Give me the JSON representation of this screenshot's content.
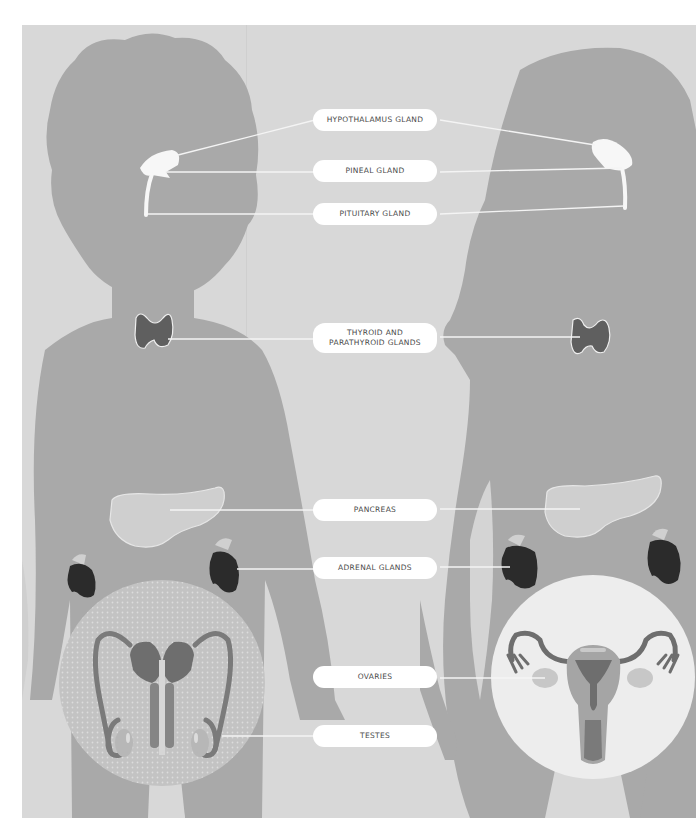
{
  "diagram": {
    "type": "endocrine-system-illustration",
    "figures": [
      "male-child-silhouette",
      "female-child-silhouette"
    ],
    "colors": {
      "page_background": "#ffffff",
      "panel_background": "#d8d8d8",
      "silhouette": "#a9a9a9",
      "label_fill": "#ffffff",
      "label_text": "#4a4a4a",
      "gland_white": "#f7f7f7",
      "thyroid": "#5f5f5f",
      "adrenal": "#2b2b2b",
      "pancreas": "#cfcfcf",
      "reproductive_dark": "#7a7a7a"
    },
    "labels": [
      {
        "id": "hypothalamus",
        "text": "HYPOTHALAMUS GLAND"
      },
      {
        "id": "pineal",
        "text": "PINEAL GLAND"
      },
      {
        "id": "pituitary",
        "text": "PITUITARY GLAND"
      },
      {
        "id": "thyroid",
        "text": "THYROID AND\nPARATHYROID GLANDS"
      },
      {
        "id": "pancreas",
        "text": "PANCREAS"
      },
      {
        "id": "adrenal",
        "text": "ADRENAL GLANDS"
      },
      {
        "id": "ovaries",
        "text": "OVARIES"
      },
      {
        "id": "testes",
        "text": "TESTES"
      }
    ]
  }
}
